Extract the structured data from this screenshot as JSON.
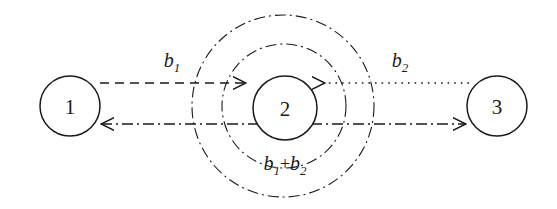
{
  "figure": {
    "kind": "node-link-diagram",
    "background_color": "#ffffff",
    "stroke_color": "#1a1a1a"
  },
  "nodes": [
    {
      "id": "node-1",
      "label": "1",
      "cx": 70,
      "cy": 106,
      "r": 30
    },
    {
      "id": "node-2",
      "label": "2",
      "cx": 285,
      "cy": 108,
      "r": 32
    },
    {
      "id": "node-3",
      "label": "3",
      "cx": 497,
      "cy": 106,
      "r": 30
    }
  ],
  "rings": [
    {
      "id": "inner-ring",
      "cx": 284,
      "cy": 106,
      "r": 62,
      "style": "dash-dot"
    },
    {
      "id": "outer-ring",
      "cx": 283,
      "cy": 106,
      "r": 91,
      "style": "dash-dot"
    }
  ],
  "edges": [
    {
      "id": "edge-1-to-2",
      "from": "1",
      "to": "2",
      "style": "dashed",
      "y": 83,
      "arrow": "to-node-2"
    },
    {
      "id": "edge-3-to-2",
      "from": "3",
      "to": "2",
      "style": "dotted",
      "y": 83,
      "arrow": "to-node-2"
    },
    {
      "id": "edge-1-to-3-lower",
      "from": "1",
      "to": "3",
      "style": "dash-dot",
      "y": 124,
      "arrow": "both-ends"
    }
  ],
  "labels": {
    "b1": {
      "base": "b",
      "sub": "1",
      "x": 172,
      "y": 67
    },
    "b2": {
      "base": "b",
      "sub": "2",
      "x": 400,
      "y": 67
    },
    "b1_plus_b2": {
      "base1": "b",
      "sub1": "1",
      "operator": "+",
      "base2": "b",
      "sub2": "2",
      "x": 285,
      "y": 168
    }
  }
}
